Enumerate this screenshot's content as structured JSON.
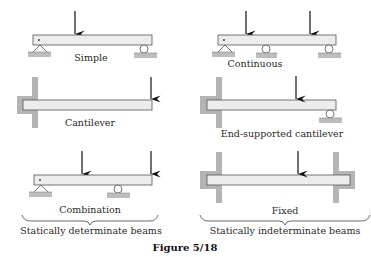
{
  "figure": {
    "caption": "Figure 5/18",
    "colors": {
      "beam_fill": "#ececec",
      "beam_stroke": "#555555",
      "support_fill": "#b4b4b4",
      "ground_fill": "#bdbdbd",
      "arrow": "#111111",
      "text": "#2a2a2a"
    },
    "panels": [
      {
        "id": "simple",
        "label": "Simple",
        "loads": 1,
        "supports": [
          "pin",
          "roller"
        ]
      },
      {
        "id": "continuous",
        "label": "Continuous",
        "loads": 2,
        "supports": [
          "pin",
          "roller",
          "roller"
        ]
      },
      {
        "id": "cantilever",
        "label": "Cantilever",
        "loads": 1,
        "supports": [
          "fixed"
        ]
      },
      {
        "id": "end-supported-cantilever",
        "label": "End-supported cantilever",
        "loads": 1,
        "supports": [
          "fixed",
          "roller"
        ]
      },
      {
        "id": "combination",
        "label": "Combination",
        "loads": 2,
        "supports": [
          "pin",
          "roller"
        ]
      },
      {
        "id": "fixed",
        "label": "Fixed",
        "loads": 1,
        "supports": [
          "fixed",
          "fixed"
        ]
      }
    ],
    "groups": [
      {
        "label": "Statically determinate beams"
      },
      {
        "label": "Statically indeterminate beams"
      }
    ]
  }
}
